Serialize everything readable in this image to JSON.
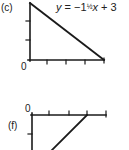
{
  "figures": [
    {
      "label": "(c)",
      "equation": {
        "lhs": "y",
        "equals": "=",
        "coef_sign": "−",
        "coef_whole": "1",
        "coef_frac": "½",
        "var": "x",
        "plus": "+",
        "const": "3"
      },
      "origin_label": "0"
    },
    {
      "label": "(f)",
      "origin_label": "0"
    }
  ],
  "colors": {
    "ink": "#1a1a1a",
    "background": "#ffffff"
  }
}
